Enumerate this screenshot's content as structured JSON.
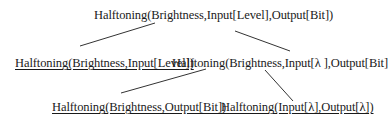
{
  "diagram": {
    "type": "tree",
    "nodes": [
      {
        "id": "root",
        "label": "Halftoning(Brightness,Input[Level],Output[Bit])",
        "underlined": false
      },
      {
        "id": "left1",
        "label": "Halftoning(Brightness,Input[Level])",
        "underlined": true
      },
      {
        "id": "right1",
        "label": "Halftoning(Brightness,Input[λ ],Output[Bit]",
        "underlined": false
      },
      {
        "id": "left2",
        "label": "Halftoning(Brightness,Output[Bit])",
        "underlined": true
      },
      {
        "id": "right2",
        "label": "Halftoning(Input[λ],Output[λ])",
        "underlined": true
      }
    ],
    "edges": [
      {
        "from": "root",
        "to": "left1"
      },
      {
        "from": "root",
        "to": "right1"
      },
      {
        "from": "right1",
        "to": "left2"
      },
      {
        "from": "right1",
        "to": "right2"
      }
    ],
    "line_color": "#333333",
    "text_color": "#1a1a1a"
  }
}
